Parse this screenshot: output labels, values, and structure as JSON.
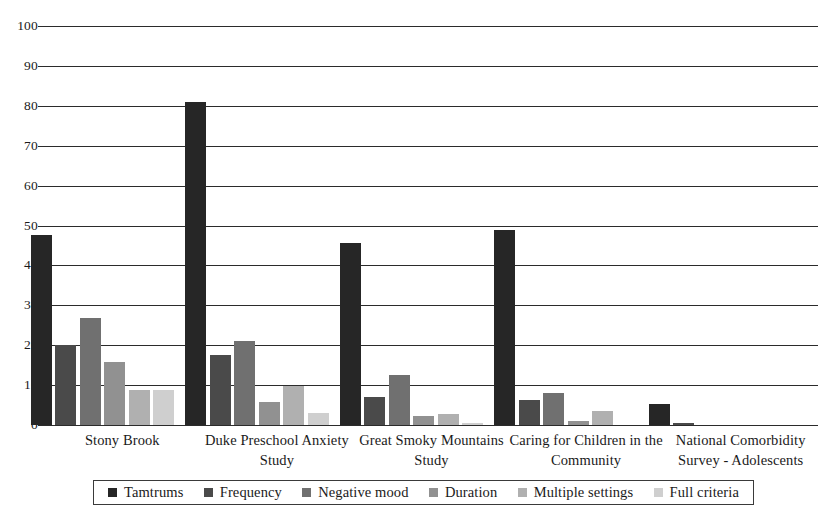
{
  "chart_data": {
    "type": "bar",
    "title": "",
    "xlabel": "",
    "ylabel": "",
    "ylim": [
      0,
      100
    ],
    "ytick_step": 10,
    "yticks": [
      "0",
      "10",
      "20",
      "30",
      "40",
      "50",
      "60",
      "70",
      "80",
      "90",
      "100"
    ],
    "grid": "horizontal",
    "legend_position": "bottom",
    "categories": [
      "Stony Brook",
      "Duke Preschool Anxiety Study",
      "Great Smoky Mountains Study",
      "Caring for Children in the Community",
      "National Comorbidity Survey - Adolescents"
    ],
    "series": [
      {
        "name": "Tamtrums",
        "color": "#262626",
        "values": [
          47.5,
          81.0,
          45.5,
          48.8,
          5.2
        ]
      },
      {
        "name": "Frequency",
        "color": "#4a4a4a",
        "values": [
          20.0,
          17.5,
          7.0,
          6.2,
          0.4
        ]
      },
      {
        "name": "Negative mood",
        "color": "#707070",
        "values": [
          26.8,
          21.0,
          12.5,
          8.1,
          0.0
        ]
      },
      {
        "name": "Duration",
        "color": "#919191",
        "values": [
          15.8,
          5.8,
          2.3,
          1.1,
          0.0
        ]
      },
      {
        "name": "Multiple settings",
        "color": "#b0b0b0",
        "values": [
          8.7,
          9.7,
          2.7,
          3.6,
          0.0
        ]
      },
      {
        "name": "Full criteria",
        "color": "#cfcfcf",
        "values": [
          8.7,
          2.9,
          0.5,
          0.0,
          0.0
        ]
      }
    ]
  },
  "axis": {
    "y_labels": [
      "100",
      "90",
      "80",
      "70",
      "60",
      "50",
      "40",
      "30",
      "20",
      "10",
      "0"
    ]
  },
  "category_labels": [
    "Stony Brook",
    "Duke Preschool Anxiety Study",
    "Great Smoky Mountains Study",
    "Caring for Children in the Community",
    "National Comorbidity Survey - Adolescents"
  ],
  "legend": {
    "items": [
      {
        "label": "Tamtrums",
        "color": "#262626"
      },
      {
        "label": "Frequency",
        "color": "#4a4a4a"
      },
      {
        "label": "Negative mood",
        "color": "#707070"
      },
      {
        "label": "Duration",
        "color": "#919191"
      },
      {
        "label": "Multiple settings",
        "color": "#b0b0b0"
      },
      {
        "label": "Full criteria",
        "color": "#cfcfcf"
      }
    ]
  }
}
